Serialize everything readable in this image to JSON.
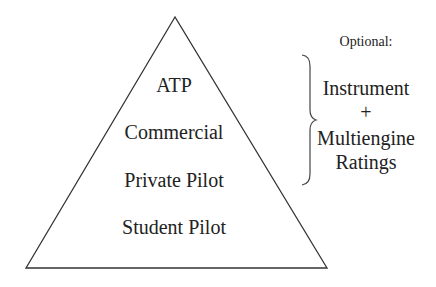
{
  "diagram": {
    "type": "pyramid",
    "levels": [
      {
        "label": "ATP"
      },
      {
        "label": "Commercial"
      },
      {
        "label": "Private Pilot"
      },
      {
        "label": "Student Pilot"
      }
    ],
    "optional": {
      "title": "Optional:",
      "line1": "Instrument",
      "plus": "+",
      "line2": "Multiengine",
      "line3": "Ratings"
    },
    "colors": {
      "stroke": "#333333",
      "text": "#222222",
      "background": "#ffffff"
    }
  }
}
